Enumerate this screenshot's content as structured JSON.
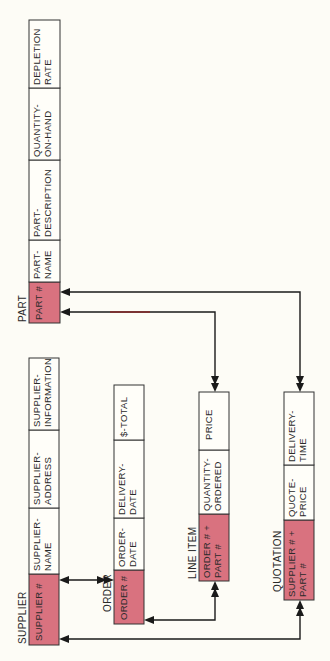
{
  "diagram": {
    "orientation": "rotated-90-ccw",
    "colors": {
      "key_fill": "#d9727f",
      "cell_fill": "#fffef9",
      "border": "#333333",
      "line": "#1a1a1a",
      "background": "#fdfcf6"
    },
    "tables": {
      "part": {
        "title": "PART",
        "columns": [
          {
            "line1": "PART #",
            "line2": "",
            "key": true
          },
          {
            "line1": "PART-",
            "line2": "NAME",
            "key": false
          },
          {
            "line1": "PART-",
            "line2": "DESCRIPTION",
            "key": false
          },
          {
            "line1": "QUANTITY-",
            "line2": "ON-HAND",
            "key": false
          },
          {
            "line1": "DEPLETION",
            "line2": "RATE",
            "key": false
          }
        ]
      },
      "supplier": {
        "title": "SUPPLIER",
        "columns": [
          {
            "line1": "SUPPLIER #",
            "line2": "",
            "key": true
          },
          {
            "line1": "SUPPLIER-",
            "line2": "NAME",
            "key": false
          },
          {
            "line1": "SUPPLIER-",
            "line2": "ADDRESS",
            "key": false
          },
          {
            "line1": "SUPPLIER-",
            "line2": "INFORMATION",
            "key": false
          }
        ]
      },
      "order": {
        "title": "ORDER",
        "columns": [
          {
            "line1": "ORDER #",
            "line2": "",
            "key": true
          },
          {
            "line1": "ORDER-",
            "line2": "DATE",
            "key": false
          },
          {
            "line1": "DELIVERY-",
            "line2": "DATE",
            "key": false
          },
          {
            "line1": "$-TOTAL",
            "line2": "",
            "key": false
          }
        ]
      },
      "line_item": {
        "title": "LINE ITEM",
        "columns": [
          {
            "line1": "ORDER # +",
            "line2": "PART #",
            "key": true
          },
          {
            "line1": "QUANTITY-",
            "line2": "ORDERED",
            "key": false
          },
          {
            "line1": "PRICE",
            "line2": "",
            "key": false
          }
        ]
      },
      "quotation": {
        "title": "QUOTATION",
        "columns": [
          {
            "line1": "SUPPLIER # +",
            "line2": "PART #",
            "key": true
          },
          {
            "line1": "QUOTE-",
            "line2": "PRICE",
            "key": false
          },
          {
            "line1": "DELIVERY-",
            "line2": "TIME",
            "key": false
          }
        ]
      }
    },
    "relationships": [
      {
        "from": "PART.PART #",
        "to": "QUOTATION.SUPPLIER # + PART #",
        "type": "one-to-many"
      },
      {
        "from": "PART.PART #",
        "to": "LINE ITEM.ORDER # + PART #",
        "type": "one-to-many"
      },
      {
        "from": "SUPPLIER.SUPPLIER #",
        "to": "ORDER.ORDER #",
        "type": "one-to-many"
      },
      {
        "from": "ORDER.ORDER #",
        "to": "LINE ITEM.ORDER # + PART #",
        "type": "one-to-many"
      },
      {
        "from": "SUPPLIER.SUPPLIER #",
        "to": "QUOTATION.SUPPLIER # + PART #",
        "type": "one-to-many"
      }
    ]
  }
}
